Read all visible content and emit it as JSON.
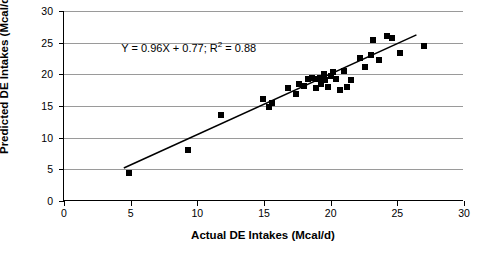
{
  "chart_data": {
    "type": "scatter",
    "title": "",
    "xlabel": "Actual DE Intakes (Mcal/d)",
    "ylabel": "Predicted DE Intakes (Mcal/d)",
    "xlim": [
      0,
      30
    ],
    "ylim": [
      0,
      30
    ],
    "xticks": [
      0,
      5,
      10,
      15,
      20,
      25,
      30
    ],
    "yticks": [
      0,
      5,
      10,
      15,
      20,
      25,
      30
    ],
    "grid": "horizontal",
    "legend": "none",
    "annotation": "Y = 0.96X + 0.77; R2 = 0.88",
    "annotation_parts": {
      "before": "Y = 0.96X + 0.77; R",
      "superscript": "2",
      "after": " = 0.88"
    },
    "trendline": {
      "slope": 0.96,
      "intercept": 0.77,
      "r_squared": 0.88,
      "x_start": 4.5,
      "x_end": 26.5
    },
    "points": [
      {
        "x": 4.9,
        "y": 4.5
      },
      {
        "x": 9.3,
        "y": 8.1
      },
      {
        "x": 11.8,
        "y": 13.6
      },
      {
        "x": 14.9,
        "y": 16.1
      },
      {
        "x": 15.4,
        "y": 14.9
      },
      {
        "x": 15.6,
        "y": 15.4
      },
      {
        "x": 16.8,
        "y": 17.9
      },
      {
        "x": 17.4,
        "y": 16.9
      },
      {
        "x": 17.6,
        "y": 18.5
      },
      {
        "x": 18.0,
        "y": 18.2
      },
      {
        "x": 18.3,
        "y": 19.2
      },
      {
        "x": 18.6,
        "y": 19.5
      },
      {
        "x": 18.9,
        "y": 17.9
      },
      {
        "x": 19.0,
        "y": 19.2
      },
      {
        "x": 19.2,
        "y": 19.5
      },
      {
        "x": 19.3,
        "y": 18.4
      },
      {
        "x": 19.5,
        "y": 20.1
      },
      {
        "x": 19.6,
        "y": 19.1
      },
      {
        "x": 19.8,
        "y": 18.0
      },
      {
        "x": 20.0,
        "y": 19.8
      },
      {
        "x": 20.2,
        "y": 20.4
      },
      {
        "x": 20.4,
        "y": 19.2
      },
      {
        "x": 20.7,
        "y": 17.6
      },
      {
        "x": 21.0,
        "y": 20.6
      },
      {
        "x": 21.2,
        "y": 18.0
      },
      {
        "x": 21.5,
        "y": 19.1
      },
      {
        "x": 22.2,
        "y": 22.6
      },
      {
        "x": 22.6,
        "y": 21.1
      },
      {
        "x": 23.0,
        "y": 23.1
      },
      {
        "x": 23.2,
        "y": 25.5
      },
      {
        "x": 23.6,
        "y": 22.3
      },
      {
        "x": 24.2,
        "y": 26.0
      },
      {
        "x": 24.6,
        "y": 25.8
      },
      {
        "x": 25.2,
        "y": 23.4
      },
      {
        "x": 27.0,
        "y": 24.5
      }
    ]
  }
}
